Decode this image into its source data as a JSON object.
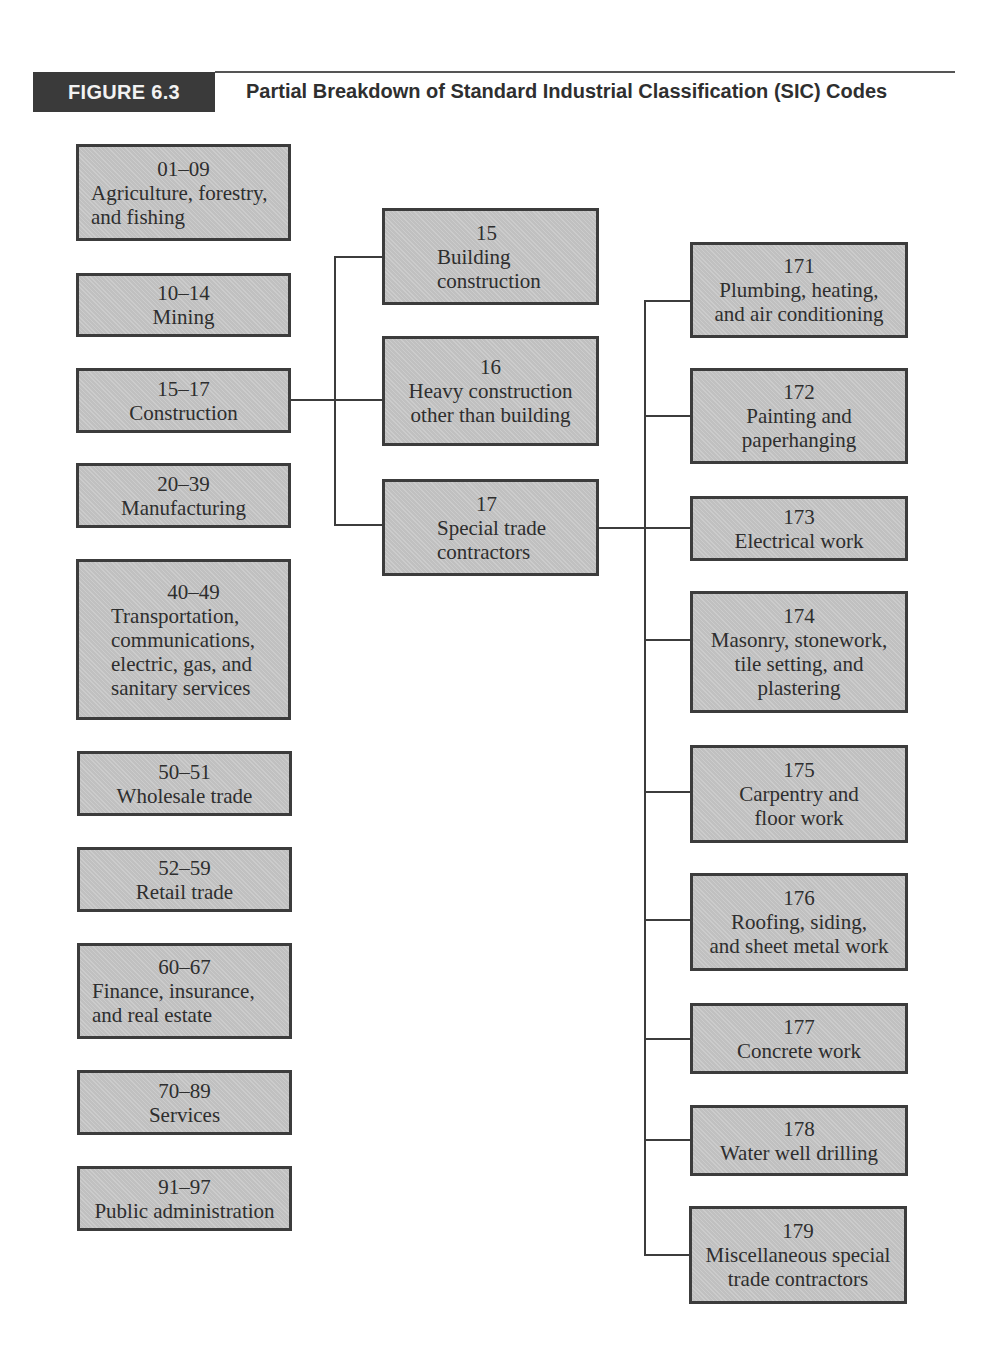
{
  "figure": {
    "label": "FIGURE 6.3",
    "title": "Partial Breakdown of Standard Industrial Classification (SIC) Codes",
    "accent_color": "#3a3a3a",
    "box_fill": "#c6c6c6",
    "box_border": "#3c3c3c"
  },
  "divisions": [
    {
      "code": "01–09",
      "label": "Agriculture, forestry,\nand fishing"
    },
    {
      "code": "10–14",
      "label": "Mining"
    },
    {
      "code": "15–17",
      "label": "Construction"
    },
    {
      "code": "20–39",
      "label": "Manufacturing"
    },
    {
      "code": "40–49",
      "label": "Transportation,\ncommunications,\nelectric, gas, and\nsanitary services"
    },
    {
      "code": "50–51",
      "label": "Wholesale trade"
    },
    {
      "code": "52–59",
      "label": "Retail trade"
    },
    {
      "code": "60–67",
      "label": "Finance, insurance,\nand real estate"
    },
    {
      "code": "70–89",
      "label": "Services"
    },
    {
      "code": "91–97",
      "label": "Public administration"
    }
  ],
  "construction_groups": [
    {
      "code": "15",
      "label": "Building\nconstruction"
    },
    {
      "code": "16",
      "label": "Heavy construction\nother than building"
    },
    {
      "code": "17",
      "label": "Special trade\ncontractors"
    }
  ],
  "special_trade_groups": [
    {
      "code": "171",
      "label": "Plumbing, heating,\nand air conditioning"
    },
    {
      "code": "172",
      "label": "Painting and\npaperhanging"
    },
    {
      "code": "173",
      "label": "Electrical work"
    },
    {
      "code": "174",
      "label": "Masonry, stonework,\ntile setting, and\nplastering"
    },
    {
      "code": "175",
      "label": "Carpentry and\nfloor work"
    },
    {
      "code": "176",
      "label": "Roofing, siding,\nand sheet metal work"
    },
    {
      "code": "177",
      "label": "Concrete work"
    },
    {
      "code": "178",
      "label": "Water well drilling"
    },
    {
      "code": "179",
      "label": "Miscellaneous special\ntrade contractors"
    }
  ]
}
